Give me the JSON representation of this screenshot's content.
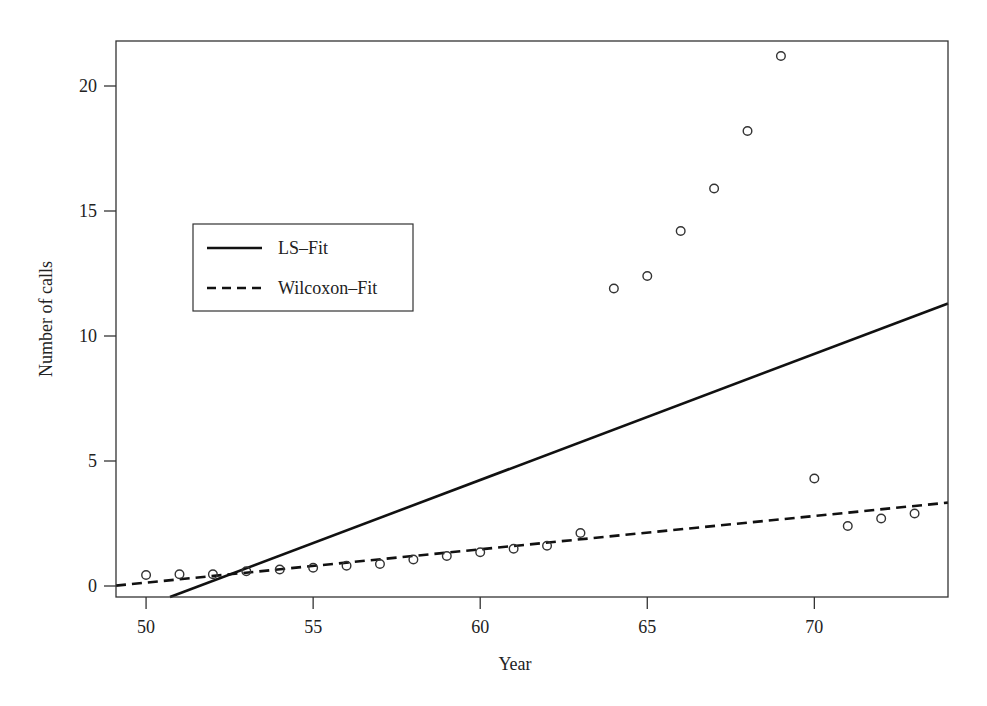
{
  "chart_data": {
    "type": "scatter",
    "title": "",
    "xlabel": "Year",
    "ylabel": "Number of calls",
    "xlim": [
      49.1,
      74.0
    ],
    "ylim": [
      -0.44,
      21.8
    ],
    "grid": false,
    "legend_position": "upper-left",
    "xticks": [
      50,
      55,
      60,
      65,
      70
    ],
    "yticks": [
      0,
      5,
      10,
      15,
      20
    ],
    "xtick_labels": [
      "50",
      "55",
      "60",
      "65",
      "70"
    ],
    "ytick_labels": [
      "0",
      "5",
      "10",
      "15",
      "20"
    ],
    "points": {
      "name": "Observed calls",
      "marker": "open-circle",
      "x": [
        50,
        51,
        52,
        53,
        54,
        55,
        56,
        57,
        58,
        59,
        60,
        61,
        62,
        63,
        64,
        65,
        66,
        67,
        68,
        69,
        70,
        71,
        72,
        73
      ],
      "y": [
        0.44,
        0.47,
        0.47,
        0.59,
        0.66,
        0.73,
        0.81,
        0.88,
        1.06,
        1.2,
        1.35,
        1.49,
        1.61,
        2.12,
        11.9,
        12.4,
        14.2,
        15.9,
        18.2,
        21.2,
        4.3,
        2.4,
        2.7,
        2.9
      ]
    },
    "series": [
      {
        "name": "LS–Fit",
        "kind": "line",
        "style": "solid",
        "intercept": -26.006,
        "slope": 0.5041
      },
      {
        "name": "Wilcoxon–Fit",
        "kind": "line",
        "style": "dashed",
        "intercept": -6.53,
        "slope": 0.1333
      }
    ],
    "colors": {
      "ink": "#111111",
      "frame": "#333333",
      "background": "#ffffff"
    }
  }
}
